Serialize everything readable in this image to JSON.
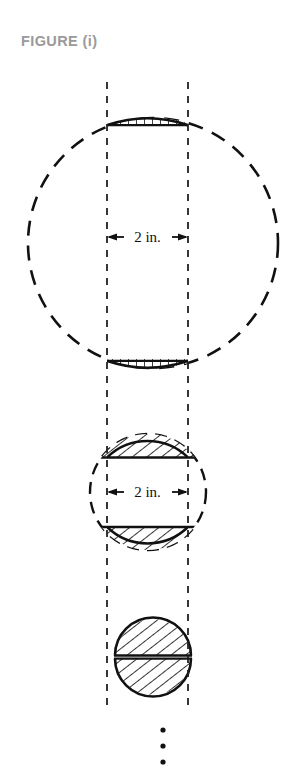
{
  "figure": {
    "title": "FIGURE (i)",
    "title_color": "#9a9a9a",
    "background_color": "#ffffff",
    "stroke_color": "#111111"
  },
  "dimensions": {
    "strip_label_top": "2 in.",
    "strip_label_middle": "2 in."
  },
  "continuation": {
    "symbol": "vertical-ellipsis",
    "dot_count": 3
  },
  "geometry": {
    "strip": {
      "left_x": 107,
      "right_x": 188,
      "top_y": 82,
      "bottom_y": 712,
      "width_in": 2
    },
    "circles": [
      {
        "name": "large-circle",
        "cx": 153,
        "cy": 243,
        "r": 125,
        "style": "dashed-outline",
        "caps": [
          "top",
          "bottom"
        ],
        "cap_hatch": "vertical"
      },
      {
        "name": "medium-circle",
        "cx": 148,
        "cy": 492,
        "r": 58,
        "style": "dashed-outline",
        "caps": [
          "top",
          "bottom"
        ],
        "cap_hatch": "diagonal"
      },
      {
        "name": "small-circle",
        "cx": 153,
        "cy": 657,
        "r": 38,
        "style": "solid-filled",
        "caps": [
          "whole"
        ],
        "cap_hatch": "diagonal"
      }
    ]
  }
}
